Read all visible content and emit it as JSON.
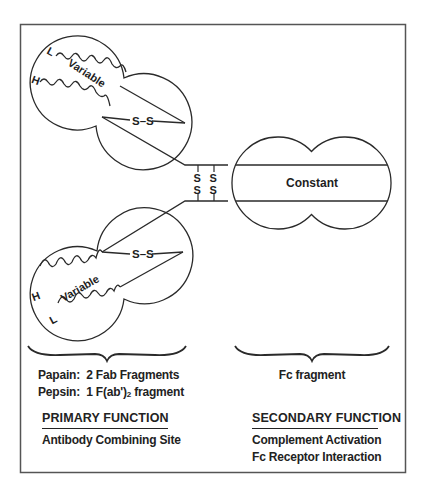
{
  "diagram": {
    "colors": {
      "line": "#2a2a2a",
      "text": "#1e1e1e",
      "background": "#ffffff"
    },
    "upper_fab": {
      "chain_light_label": "L",
      "chain_heavy_label": "H",
      "region_label": "Variable",
      "disulfide_label": "S–S"
    },
    "lower_fab": {
      "chain_heavy_label": "H",
      "chain_light_label": "L",
      "region_label": "Variable",
      "disulfide_label": "S–S"
    },
    "hinge": {
      "bond_1_top": "S",
      "bond_1_bottom": "S",
      "bond_2_top": "S",
      "bond_2_bottom": "S"
    },
    "fc": {
      "region_label": "Constant"
    }
  },
  "left_panel": {
    "papain_label": "Papain:",
    "papain_value": "2 Fab Fragments",
    "pepsin_label": "Pepsin:",
    "pepsin_value_prefix": "1 F(ab')",
    "pepsin_value_subscript": "2",
    "pepsin_value_suffix": " fragment",
    "heading": "PRIMARY FUNCTION",
    "functions": [
      "Antibody Combining Site"
    ]
  },
  "right_panel": {
    "fragment_label": "Fc fragment",
    "heading": "SECONDARY FUNCTION",
    "functions": [
      "Complement Activation",
      "Fc Receptor Interaction"
    ]
  }
}
